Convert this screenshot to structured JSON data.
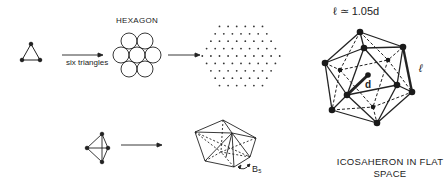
{
  "figure": {
    "hexagon_label": "HEXAGON",
    "arrow_label": "six triangles",
    "equation": "ℓ ≃ 1.05d",
    "edge_label": "ℓ",
    "radius_label": "d",
    "b5_label": "B₅",
    "caption_line1": "ICOSAHERON IN FLAT",
    "caption_line2": "SPACE"
  },
  "colors": {
    "ink": "#222222",
    "background": "#ffffff"
  },
  "shapes": {
    "triangle": "three-vertex triangle",
    "hexagon_packing": "seven circles in hexagonal arrangement",
    "triangular_lattice": "hexagonal dot lattice",
    "tetrahedron": "four-vertex tetrahedron",
    "pentagonal_bipyramid": "B5 structure",
    "icosahedron": "icosahedron with central atom"
  }
}
